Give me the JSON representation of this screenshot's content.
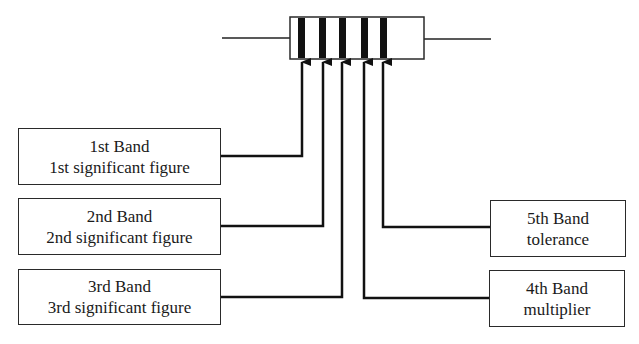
{
  "resistor": {
    "bands": 5,
    "band_color": "#111111",
    "body_outline_color": "#2a2a2a"
  },
  "labels": {
    "band1": {
      "title": "1st Band",
      "description": "1st significant figure"
    },
    "band2": {
      "title": "2nd Band",
      "description": "2nd significant figure"
    },
    "band3": {
      "title": "3rd Band",
      "description": "3rd significant figure"
    },
    "band4": {
      "title": "4th Band",
      "description": "multiplier"
    },
    "band5": {
      "title": "5th Band",
      "description": "tolerance"
    }
  }
}
